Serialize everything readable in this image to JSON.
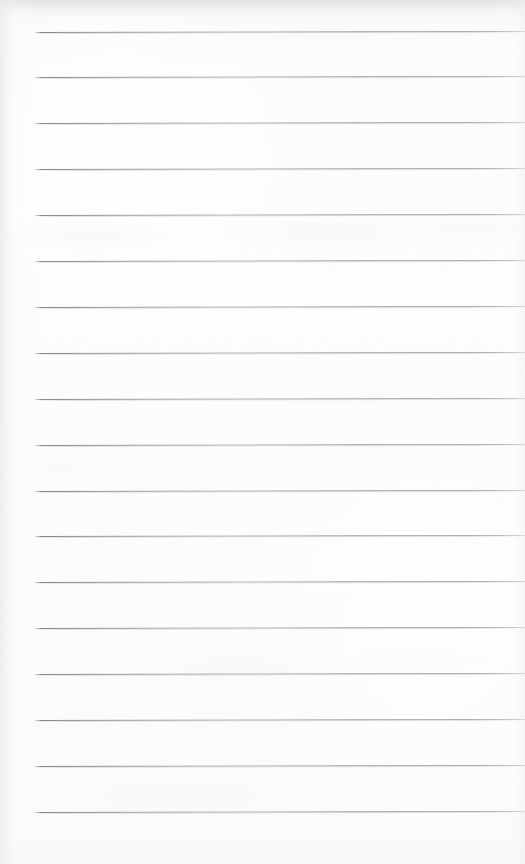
{
  "document": {
    "kind": "scanned-blank-lined-notebook-page",
    "title": "Blank ruled notebook page",
    "page_width": 525,
    "page_height": 864,
    "has_text_content": false,
    "visible_text": "",
    "background_color": "#fdfdfd",
    "paper_tone": "#fbfbfb",
    "rule_color": "#8a8a90",
    "rule_shadow_color": "#bcbcc2"
  },
  "ruling": {
    "line_count": 18,
    "first_line_y": 31.5,
    "line_spacing": 45.9,
    "line_thickness": 1,
    "left_margin_x": 35,
    "right_end_x": 525,
    "slope_degrees": -0.12,
    "lines": [
      {
        "index": 1,
        "y": 31.5,
        "x_start": 35,
        "x_end": 525
      },
      {
        "index": 2,
        "y": 77.4,
        "x_start": 35,
        "x_end": 525
      },
      {
        "index": 3,
        "y": 123.3,
        "x_start": 35,
        "x_end": 525
      },
      {
        "index": 4,
        "y": 169.2,
        "x_start": 35,
        "x_end": 525
      },
      {
        "index": 5,
        "y": 215.1,
        "x_start": 35,
        "x_end": 525
      },
      {
        "index": 6,
        "y": 261.0,
        "x_start": 35,
        "x_end": 525
      },
      {
        "index": 7,
        "y": 306.9,
        "x_start": 35,
        "x_end": 525
      },
      {
        "index": 8,
        "y": 352.8,
        "x_start": 35,
        "x_end": 525
      },
      {
        "index": 9,
        "y": 398.7,
        "x_start": 35,
        "x_end": 525
      },
      {
        "index": 10,
        "y": 444.6,
        "x_start": 35,
        "x_end": 525
      },
      {
        "index": 11,
        "y": 490.5,
        "x_start": 35,
        "x_end": 525
      },
      {
        "index": 12,
        "y": 536.4,
        "x_start": 35,
        "x_end": 525
      },
      {
        "index": 13,
        "y": 582.3,
        "x_start": 35,
        "x_end": 525
      },
      {
        "index": 14,
        "y": 628.2,
        "x_start": 35,
        "x_end": 525
      },
      {
        "index": 15,
        "y": 674.1,
        "x_start": 35,
        "x_end": 525
      },
      {
        "index": 16,
        "y": 720.0,
        "x_start": 35,
        "x_end": 525
      },
      {
        "index": 17,
        "y": 765.9,
        "x_start": 35,
        "x_end": 525
      },
      {
        "index": 18,
        "y": 811.8,
        "x_start": 35,
        "x_end": 525
      }
    ]
  },
  "scan_artifacts": {
    "top_band_height": 18,
    "top_band_color": "#e4e4e7",
    "left_edge_shadow": true,
    "bleed_through_bands": [
      {
        "y": 232,
        "height": 14,
        "note": "faint ghost of writing from reverse side"
      },
      {
        "y": 664,
        "height": 12,
        "note": "faint ghost smudge"
      }
    ]
  }
}
